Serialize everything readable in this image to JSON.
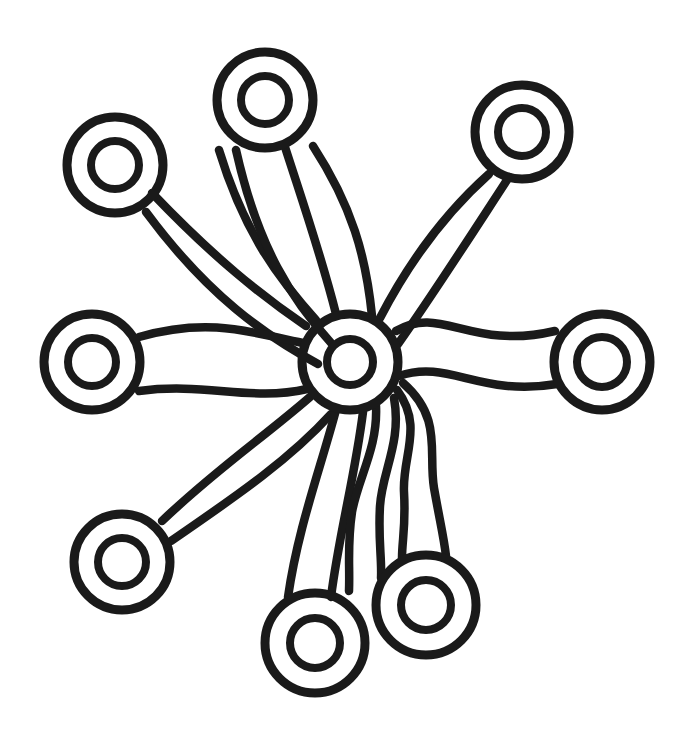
{
  "artwork": {
    "title": "Radial Tentacle Mandala Line Drawing",
    "style": "coloring-page line art",
    "background_color": "#ffffff",
    "ink_color": "#1a1a1a",
    "canvas": {
      "width": 696,
      "height": 740
    },
    "stroke_width_px": 8.5,
    "node_count": 9,
    "arm_count": 8
  },
  "hub": {
    "name": "central-ring",
    "cx": 350,
    "cy": 362,
    "outer_r": 48,
    "inner_r": 23
  },
  "nodes": [
    {
      "id": "node-top",
      "label": "top ring",
      "cx": 265,
      "cy": 100,
      "outer_r": 48,
      "inner_r": 24
    },
    {
      "id": "node-upper-left",
      "label": "upper left ring",
      "cx": 115,
      "cy": 165,
      "outer_r": 48,
      "inner_r": 24
    },
    {
      "id": "node-upper-right",
      "label": "upper right ring",
      "cx": 522,
      "cy": 132,
      "outer_r": 47,
      "inner_r": 24
    },
    {
      "id": "node-left",
      "label": "left ring",
      "cx": 92,
      "cy": 362,
      "outer_r": 48,
      "inner_r": 24
    },
    {
      "id": "node-right",
      "label": "right ring",
      "cx": 602,
      "cy": 362,
      "outer_r": 48,
      "inner_r": 25
    },
    {
      "id": "node-lower-left",
      "label": "lower left ring",
      "cx": 122,
      "cy": 562,
      "outer_r": 48,
      "inner_r": 24
    },
    {
      "id": "node-bottom",
      "label": "bottom ring",
      "cx": 315,
      "cy": 643,
      "outer_r": 50,
      "inner_r": 25
    },
    {
      "id": "node-bottom-right",
      "label": "bottom right ring",
      "cx": 426,
      "cy": 605,
      "outer_r": 50,
      "inner_r": 25
    }
  ],
  "arms": [
    {
      "id": "arm-top",
      "label": "arm to top ring",
      "from": "hub",
      "to": "node-top",
      "edge_a": "M 332 315 C 318 262 300 210 283 148",
      "edge_b": "M 368 318 C 362 258 350 208 312 146"
    },
    {
      "id": "arm-upper-left",
      "label": "arm to upper left ring",
      "from": "hub",
      "to": "node-upper-left",
      "edge_a": "M 308 330 C 262 300 216 262 155 196",
      "edge_b": "M 322 362 C 268 332 212 296 148 214"
    },
    {
      "id": "arm-upper-left-inner",
      "label": "inner arm between top and upper-left",
      "from": "hub",
      "to": "node-top",
      "edge_a": "M 318 322 C 282 280 250 238 222 150",
      "edge_b": "M 330 346 C 290 300 256 250 236 148"
    },
    {
      "id": "arm-upper-right",
      "label": "arm to upper right ring",
      "from": "hub",
      "to": "node-upper-right",
      "edge_a": "M 378 320 C 406 266 440 218 490 175",
      "edge_b": "M 396 344 C 430 296 462 246 508 178"
    },
    {
      "id": "arm-left",
      "label": "arm to left ring",
      "from": "hub",
      "to": "node-left",
      "edge_a": "M 304 344 C 256 336 212 318 140 338",
      "edge_b": "M 308 388 C 252 400 206 382 140 390"
    },
    {
      "id": "arm-right",
      "label": "arm to right ring",
      "from": "hub",
      "to": "node-right",
      "edge_a": "M 396 332 C 440 306 470 352 554 332",
      "edge_b": "M 398 374 C 448 358 478 396 556 382"
    },
    {
      "id": "arm-lower-left",
      "label": "arm to lower left ring",
      "from": "hub",
      "to": "node-lower-left",
      "edge_a": "M 312 396 C 266 436 216 470 164 520",
      "edge_b": "M 330 412 C 290 456 240 492 172 540"
    },
    {
      "id": "arm-bottom",
      "label": "arm to bottom ring",
      "from": "hub",
      "to": "node-bottom",
      "edge_a": "M 338 410 C 322 470 300 528 290 596",
      "edge_b": "M 362 412 C 354 476 338 534 330 596"
    },
    {
      "id": "arm-bottom-right-inner",
      "label": "inner arm between bottom and bottom-right",
      "from": "hub",
      "to": "node-bottom",
      "edge_a": "M 372 408 C 372 470 360 520 348 590",
      "edge_b": "M 392 400 C 398 462 386 514 376 578"
    },
    {
      "id": "arm-bottom-right",
      "label": "arm to bottom right ring",
      "from": "hub",
      "to": "node-bottom-right",
      "edge_a": "M 396 392 C 420 440 400 486 404 556",
      "edge_b": "M 400 386 C 438 428 424 480 444 554"
    }
  ]
}
